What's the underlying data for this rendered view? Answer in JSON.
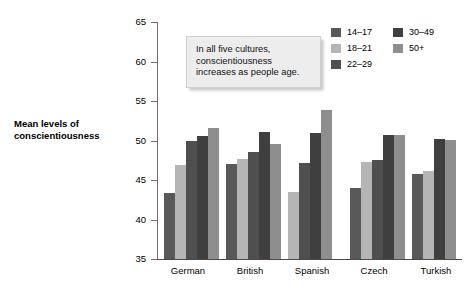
{
  "chart_data": {
    "type": "bar",
    "title": "",
    "subtitle": "",
    "xlabel": "",
    "ylabel": "Mean levels of conscientiousness",
    "ylim": [
      35,
      65
    ],
    "ytick_step": 5,
    "yticks": [
      35,
      40,
      45,
      50,
      55,
      60,
      65
    ],
    "grid": false,
    "legend_position": "top-right",
    "categories": [
      "German",
      "British",
      "Spanish",
      "Czech",
      "Turkish"
    ],
    "series": [
      {
        "name": "14–17",
        "color": "#595959",
        "values": [
          43.3,
          47.0,
          null,
          44.0,
          45.8
        ]
      },
      {
        "name": "18–21",
        "color": "#b5b5b5",
        "values": [
          46.9,
          47.6,
          43.5,
          47.3,
          46.1
        ]
      },
      {
        "name": "22–29",
        "color": "#4f4f4f",
        "values": [
          50.0,
          48.5,
          47.1,
          47.5,
          null
        ]
      },
      {
        "name": "30–49",
        "color": "#3f3f3f",
        "values": [
          50.6,
          51.1,
          50.9,
          50.7,
          50.2
        ]
      },
      {
        "name": "50+",
        "color": "#8e8e8e",
        "values": [
          51.6,
          49.6,
          53.8,
          50.7,
          50.1
        ]
      }
    ],
    "annotations": [
      {
        "text": "In all five cultures, conscientiousness increases as people age."
      }
    ]
  },
  "axis": {
    "y_title": "Mean levels of conscientiousness",
    "tick_labels": [
      "65",
      "60",
      "55",
      "50",
      "45",
      "40",
      "35"
    ],
    "category_labels": [
      "German",
      "British",
      "Spanish",
      "Czech",
      "Turkish"
    ]
  },
  "callout": {
    "line1": "In all five cultures,",
    "line2": "conscientiousness",
    "line3": "increases as people age."
  },
  "legend": {
    "column1": [
      {
        "label": "14–17",
        "color": "#595959"
      },
      {
        "label": "18–21",
        "color": "#b5b5b5"
      },
      {
        "label": "22–29",
        "color": "#4f4f4f"
      }
    ],
    "column2": [
      {
        "label": "30–49",
        "color": "#3f3f3f"
      },
      {
        "label": "50+",
        "color": "#8e8e8e"
      }
    ]
  }
}
